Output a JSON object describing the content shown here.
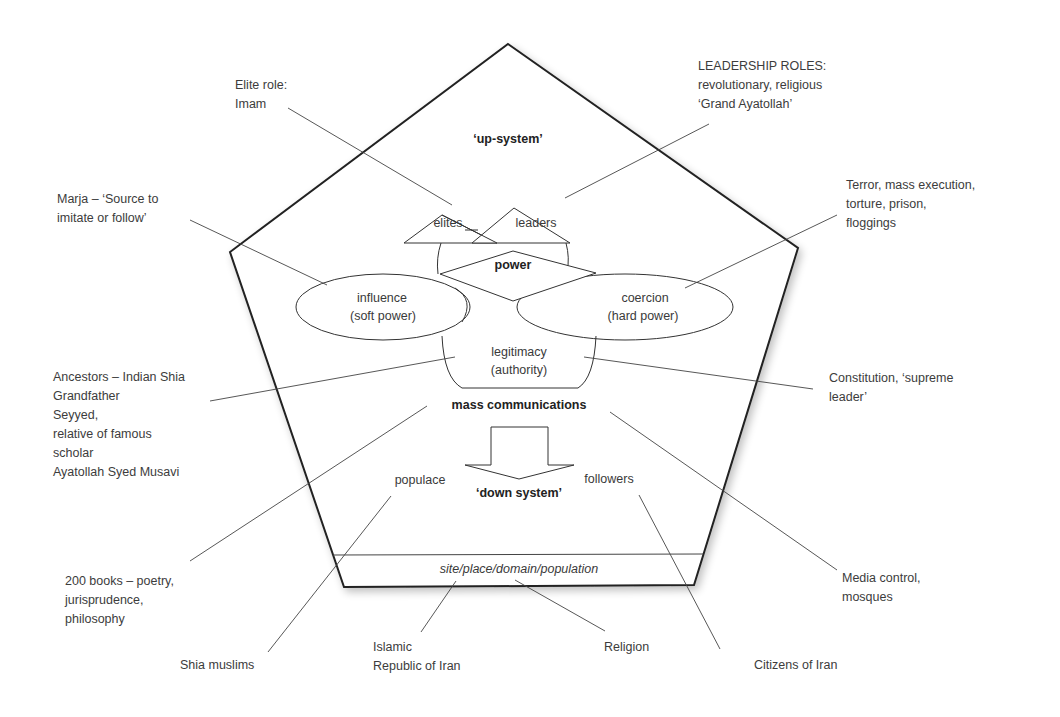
{
  "diagram": {
    "type": "pentagon-power-model",
    "shape_labels": {
      "up_system": "‘up-system’",
      "elites": "elites",
      "leaders": "leaders",
      "power": "power",
      "influence_line1": "influence",
      "influence_line2": "(soft power)",
      "coercion_line1": "coercion",
      "coercion_line2": "(hard power)",
      "legitimacy_line1": "legitimacy",
      "legitimacy_line2": "(authority)",
      "mass_communications": "mass communications",
      "populace": "populace",
      "followers": "followers",
      "down_system": "‘down system’",
      "site": "site/place/domain/population"
    },
    "annotations": {
      "elite_role": "Elite role:\nImam",
      "leadership_roles": "LEADERSHIP ROLES:\nrevolutionary, religious\n‘Grand Ayatollah’",
      "marja": "Marja – ‘Source to\nimitate or follow’",
      "terror": "Terror, mass execution,\ntorture, prison,\nfloggings",
      "ancestors": "Ancestors – Indian Shia\nGrandfather\nSeyyed,\nrelative of famous\nscholar\nAyatollah Syed Musavi",
      "constitution": "Constitution, ‘supreme\nleader’",
      "books": "200 books – poetry,\njurisprudence,\nphilosophy",
      "media": "Media control,\nmosques",
      "shia_muslims": "Shia muslims",
      "islamic_republic": "Islamic\nRepublic of Iran",
      "religion": "Religion",
      "citizens": "Citizens of Iran"
    },
    "colors": {
      "stroke": "#2a2a2a",
      "text": "#3a3a3a",
      "background": "#ffffff"
    }
  }
}
